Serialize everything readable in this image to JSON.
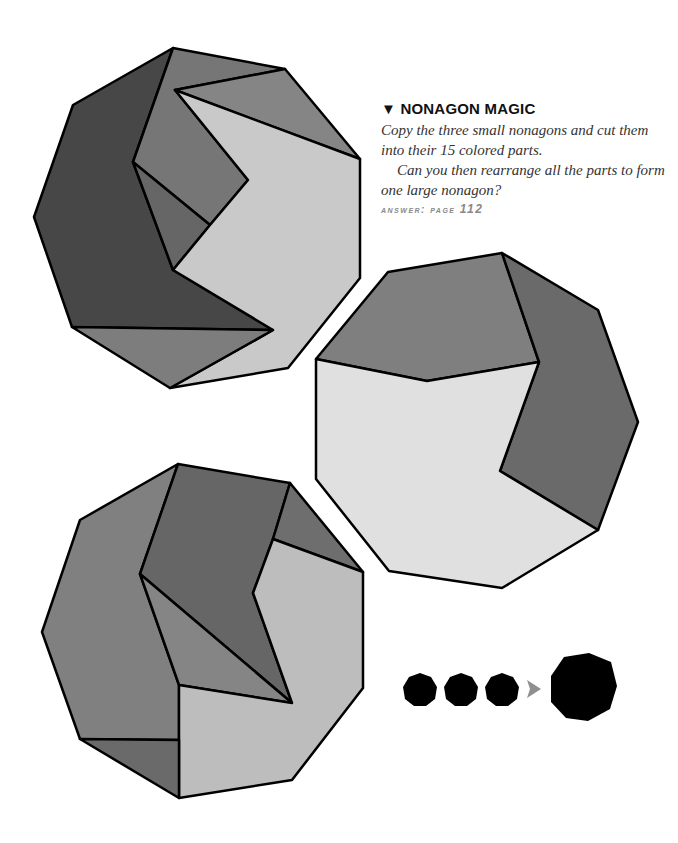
{
  "puzzle": {
    "title_marker": "▼",
    "title": "NONAGON MAGIC",
    "paragraph1": "Copy the three small nonagons and cut them into their 15 colored parts.",
    "paragraph2": "Can you then rearrange all the parts to form one large nonagon?",
    "answer_label": "Answer: page",
    "answer_page": "112"
  },
  "colors": {
    "dark": "#474747",
    "mid": "#7d7d7d",
    "middark": "#6a6a6a",
    "light": "#c9c9c9",
    "lighter": "#e0e0e0",
    "outline": "#000000",
    "arrow": "#8f8f8f"
  },
  "legend": {
    "small_nonagons": 3,
    "arrow_icon": "right-arrow-icon",
    "large_nonagons": 1
  }
}
